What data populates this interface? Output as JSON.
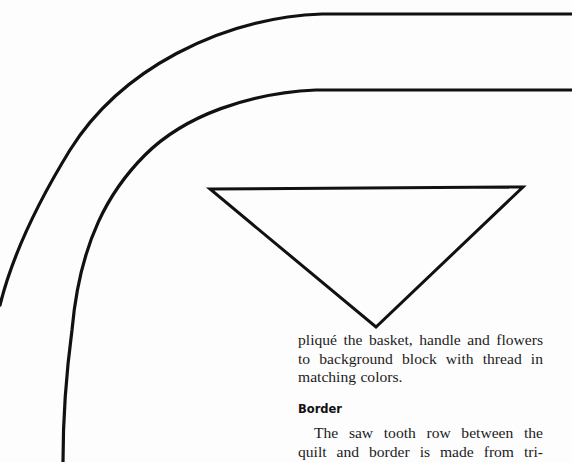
{
  "page": {
    "type": "quilt pattern page",
    "background_color": "#fdfdfd",
    "line_color": "#111111"
  },
  "diagram": {
    "outer_border_curve": {
      "label": "outer border template curve"
    },
    "inner_border_curve": {
      "label": "inner border template curve"
    },
    "triangle_template": {
      "label": "saw tooth triangle template",
      "vertices": [
        [
          210,
          189
        ],
        [
          523,
          187
        ],
        [
          376,
          327
        ]
      ]
    }
  },
  "text": {
    "paragraph_1_lines": [
      "pliqué the basket, handle and flowers",
      "to background block with thread in",
      "matching colors."
    ],
    "border_heading": "Border",
    "paragraph_2_lines": [
      "The saw tooth row between the",
      "quilt and border is made from tri-"
    ]
  }
}
